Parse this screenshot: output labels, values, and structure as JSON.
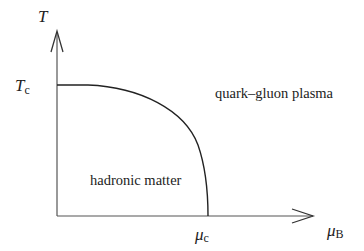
{
  "diagram": {
    "type": "phase-diagram",
    "y_axis": {
      "symbol": "T"
    },
    "x_axis": {
      "symbol": "μ",
      "subscript": "B"
    },
    "tc_label": {
      "symbol": "T",
      "subscript": "c"
    },
    "muc_label": {
      "symbol": "μ",
      "subscript": "c"
    },
    "regions": {
      "upper": "quark–gluon plasma",
      "lower": "hadronic matter"
    },
    "colors": {
      "line": "#222222",
      "axis": "#555555"
    }
  }
}
